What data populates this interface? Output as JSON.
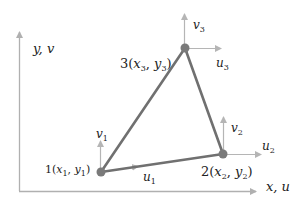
{
  "colors": {
    "axis": "#b0b0b0",
    "element_edge": "#707070",
    "node": "#7a7a7a",
    "dof_arrow": "#b5b5b5",
    "text": "#222222"
  },
  "axes": {
    "y_label": "y, v",
    "x_label": "x, u"
  },
  "nodes": [
    {
      "id": "1",
      "label_num": "1",
      "coord_label": "(x1, y1)",
      "x_sym": "x",
      "x_sub": "1",
      "y_sym": "y",
      "y_sub": "1",
      "u_label": "u",
      "u_sub": "1",
      "v_label": "v",
      "v_sub": "1"
    },
    {
      "id": "2",
      "label_num": "2",
      "coord_label": "(x2, y2)",
      "x_sym": "x",
      "x_sub": "2",
      "y_sym": "y",
      "y_sub": "2",
      "u_label": "u",
      "u_sub": "2",
      "v_label": "v",
      "v_sub": "2"
    },
    {
      "id": "3",
      "label_num": "3",
      "coord_label": "(x3, y3)",
      "x_sym": "x",
      "x_sub": "3",
      "y_sym": "y",
      "y_sub": "3",
      "u_label": "u",
      "u_sub": "3",
      "v_label": "v",
      "v_sub": "3"
    }
  ]
}
